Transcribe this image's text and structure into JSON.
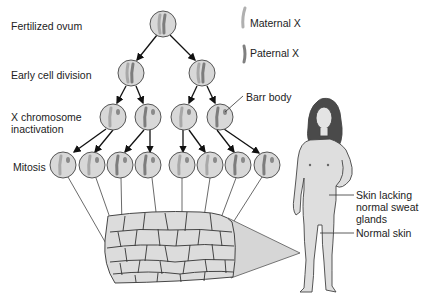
{
  "labels": {
    "fertilized_ovum": "Fertilized ovum",
    "early_cell_division": "Early cell division",
    "x_inactivation_1": "X chromosome",
    "x_inactivation_2": "inactivation",
    "mitosis": "Mitosis",
    "barr_body": "Barr body",
    "skin_lacking_1": "Skin lacking",
    "skin_lacking_2": "normal sweat",
    "skin_lacking_3": "glands",
    "normal_skin": "Normal skin"
  },
  "legend": {
    "maternal": "Maternal X",
    "paternal": "Paternal X"
  },
  "colors": {
    "cell_fill": "#d8d8d8",
    "cell_stroke": "#555555",
    "maternal_x": "#b5b5b5",
    "paternal_x": "#8a8a8a",
    "skin": "#dedede",
    "hair": "#4a4a4a"
  }
}
